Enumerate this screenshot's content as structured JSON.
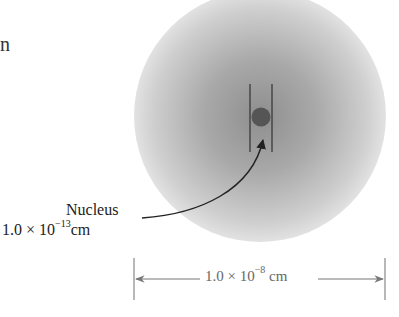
{
  "figure": {
    "partial_text": "n",
    "nucleus": {
      "name": "Nucleus",
      "size_mantissa": "1.0 × 10",
      "size_exponent": "−13",
      "size_unit": "cm"
    },
    "atom_dimension": {
      "mantissa": "1.0 × 10",
      "exponent": "−8",
      "unit": " cm"
    },
    "colors": {
      "electron_cloud_center": "#8e8e8e",
      "electron_cloud_edge": "#dcdcdc",
      "nucleus": "#555555",
      "lines": "#333333",
      "dimension_lines": "#777777"
    }
  }
}
